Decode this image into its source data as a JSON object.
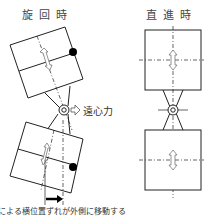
{
  "diagram": {
    "left": {
      "title": "旋回時",
      "force_label": "遠心力"
    },
    "right": {
      "title": "直進時"
    },
    "caption": "による横位置ずれが外側に移動する"
  },
  "colors": {
    "line": "#222222",
    "dot": "#000000",
    "text": "#333333"
  }
}
